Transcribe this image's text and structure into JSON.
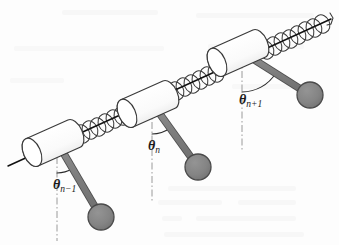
{
  "figure": {
    "type": "diagram",
    "background_color": "#fdfdfd",
    "width": 339,
    "height": 245
  },
  "colors": {
    "ink": "#1a1a1a",
    "rod_fill": "#808080",
    "rod_stroke": "#4d4d4d",
    "bob_fill": "#828282",
    "bob_stroke": "#4a4a4a",
    "cylinder_fill": "#fbfbfb",
    "cylinder_stroke": "#3a3a3a",
    "spring_stroke": "#3a3a3a",
    "axis_stroke": "#111111",
    "dashdot_stroke": "#9a9a9a",
    "arc_stroke": "#2a2a2a",
    "bleed_through": "#f2f2f2"
  },
  "axis": {
    "name": "spring-axis",
    "start": [
      8,
      166
    ],
    "end": [
      333,
      18
    ],
    "coil_count": 46,
    "coil_radius": 7.5,
    "has_end_hook": true
  },
  "pendulums": [
    {
      "id": "pendulum-n-minus-1",
      "label": "θ",
      "subscript": "n−1",
      "label_pos": [
        57,
        186
      ],
      "pivot": [
        57,
        142
      ],
      "bob_center": [
        101,
        217
      ],
      "bob_radius": 13,
      "rod_width": 6,
      "angle_from_vertical_deg": 30,
      "cylinder_center": [
        53,
        143
      ],
      "cylinder_length": 46,
      "cylinder_radius": 15
    },
    {
      "id": "pendulum-n",
      "label": "θ",
      "subscript": "n",
      "label_pos": [
        152,
        147
      ],
      "pivot": [
        152,
        103
      ],
      "bob_center": [
        198,
        167
      ],
      "bob_radius": 13,
      "rod_width": 6,
      "angle_from_vertical_deg": 36,
      "cylinder_center": [
        148,
        104
      ],
      "cylinder_length": 46,
      "cylinder_radius": 15
    },
    {
      "id": "pendulum-n-plus-1",
      "label": "θ",
      "subscript": "n+1",
      "label_pos": [
        243,
        101
      ],
      "pivot": [
        242,
        52
      ],
      "bob_center": [
        310,
        95
      ],
      "bob_radius": 13,
      "rod_width": 6,
      "angle_from_vertical_deg": 58,
      "cylinder_center": [
        238,
        53
      ],
      "cylinder_length": 46,
      "cylinder_radius": 15
    }
  ],
  "reference_lines": [
    {
      "name": "vertical-dashdot-n-minus-1",
      "x": 57,
      "y_top": 130,
      "y_bottom": 240
    },
    {
      "name": "vertical-dashdot-n",
      "x": 152,
      "y_top": 95,
      "y_bottom": 200
    },
    {
      "name": "vertical-dashdot-n-plus-1",
      "x": 242,
      "y_top": 44,
      "y_bottom": 150
    }
  ],
  "angle_arcs": [
    {
      "name": "arc-n-minus-1",
      "cx": 57,
      "cy": 142,
      "r": 31
    },
    {
      "name": "arc-n",
      "cx": 152,
      "cy": 103,
      "r": 31
    },
    {
      "name": "arc-n-plus-1",
      "cx": 242,
      "cy": 52,
      "r": 40
    }
  ]
}
